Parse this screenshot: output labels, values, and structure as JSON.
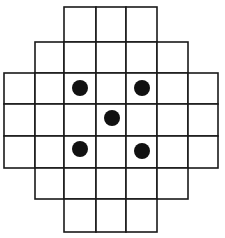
{
  "diagram": {
    "title": "",
    "type": "cross-shaped grid board with pieces",
    "colors": {
      "background": "#ffffff",
      "line": "#1a1a1a",
      "piece": "#111111"
    },
    "columns_x": [
      4,
      35,
      64,
      96,
      126,
      157,
      188,
      218
    ],
    "rows_y": [
      7,
      42,
      73,
      104,
      136,
      168,
      199,
      232
    ],
    "row_spans": [
      {
        "row": 0,
        "col_start": 2,
        "col_end": 5
      },
      {
        "row": 1,
        "col_start": 1,
        "col_end": 6
      },
      {
        "row": 2,
        "col_start": 0,
        "col_end": 7
      },
      {
        "row": 3,
        "col_start": 0,
        "col_end": 7
      },
      {
        "row": 4,
        "col_start": 0,
        "col_end": 7
      },
      {
        "row": 5,
        "col_start": 1,
        "col_end": 6
      },
      {
        "row": 6,
        "col_start": 2,
        "col_end": 5
      }
    ],
    "pieces": [
      {
        "label": "dot-top-left",
        "cx": 80,
        "cy": 88,
        "r": 8
      },
      {
        "label": "dot-top-right",
        "cx": 142,
        "cy": 88,
        "r": 8
      },
      {
        "label": "dot-center",
        "cx": 112,
        "cy": 118,
        "r": 8
      },
      {
        "label": "dot-bottom-left",
        "cx": 80,
        "cy": 149,
        "r": 8
      },
      {
        "label": "dot-bottom-right",
        "cx": 142,
        "cy": 151,
        "r": 8
      }
    ]
  }
}
